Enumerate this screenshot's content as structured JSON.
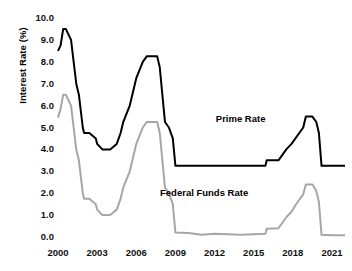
{
  "chart_data": {
    "type": "line",
    "title": "",
    "xlabel": "",
    "ylabel": "Interest Rate (%)",
    "xlim": [
      2000,
      2022
    ],
    "ylim": [
      0.0,
      10.0
    ],
    "grid": false,
    "legend_position": "inline-annotations",
    "x_tick_labels": [
      "2000",
      "2003",
      "2006",
      "2009",
      "2012",
      "2015",
      "2018",
      "2021"
    ],
    "x_tick_values": [
      2000,
      2003,
      2006,
      2009,
      2012,
      2015,
      2018,
      2021
    ],
    "y_tick_labels": [
      "10.0",
      "9.0",
      "8.0",
      "7.0",
      "6.0",
      "5.0",
      "4.0",
      "3.0",
      "2.0",
      "1.0",
      "0.0"
    ],
    "y_tick_values": [
      10.0,
      9.0,
      8.0,
      7.0,
      6.0,
      5.0,
      4.0,
      3.0,
      2.0,
      1.0,
      0.0
    ],
    "annotations": [
      {
        "text": "Prime Rate",
        "x": 2014.0,
        "y": 5.4
      },
      {
        "text": "Federal Funds  Rate",
        "x": 2011.2,
        "y": 2.0
      }
    ],
    "series": [
      {
        "name": "Prime Rate",
        "color": "#000000",
        "x": [
          2000.0,
          2000.2,
          2000.4,
          2000.6,
          2001.0,
          2001.2,
          2001.4,
          2001.6,
          2001.9,
          2002.0,
          2002.4,
          2002.9,
          2003.0,
          2003.4,
          2003.6,
          2004.0,
          2004.5,
          2004.8,
          2005.0,
          2005.5,
          2006.0,
          2006.5,
          2006.8,
          2007.0,
          2007.6,
          2007.8,
          2008.0,
          2008.2,
          2008.5,
          2008.8,
          2009.0,
          2010.0,
          2011.0,
          2012.0,
          2013.0,
          2014.0,
          2015.0,
          2015.9,
          2016.0,
          2016.9,
          2017.2,
          2017.5,
          2017.9,
          2018.2,
          2018.5,
          2018.8,
          2019.0,
          2019.5,
          2019.8,
          2020.0,
          2020.2,
          2021.0,
          2022.0
        ],
        "y": [
          8.5,
          8.75,
          9.5,
          9.5,
          9.0,
          8.0,
          7.0,
          6.5,
          5.0,
          4.75,
          4.75,
          4.5,
          4.25,
          4.0,
          4.0,
          4.0,
          4.25,
          4.75,
          5.25,
          6.0,
          7.25,
          8.0,
          8.25,
          8.25,
          8.25,
          7.75,
          6.5,
          5.25,
          5.0,
          4.5,
          3.25,
          3.25,
          3.25,
          3.25,
          3.25,
          3.25,
          3.25,
          3.25,
          3.5,
          3.5,
          3.75,
          4.0,
          4.25,
          4.5,
          4.75,
          5.0,
          5.5,
          5.5,
          5.25,
          4.75,
          3.25,
          3.25,
          3.25
        ]
      },
      {
        "name": "Federal Funds Rate",
        "color": "#a6a6a6",
        "x": [
          2000.0,
          2000.2,
          2000.4,
          2000.6,
          2001.0,
          2001.2,
          2001.4,
          2001.6,
          2001.9,
          2002.0,
          2002.4,
          2002.9,
          2003.0,
          2003.4,
          2003.6,
          2004.0,
          2004.5,
          2004.8,
          2005.0,
          2005.5,
          2006.0,
          2006.5,
          2006.8,
          2007.0,
          2007.6,
          2007.8,
          2008.0,
          2008.2,
          2008.5,
          2008.8,
          2009.0,
          2010.0,
          2011.0,
          2012.0,
          2013.0,
          2014.0,
          2015.0,
          2015.9,
          2016.0,
          2016.9,
          2017.2,
          2017.5,
          2017.9,
          2018.2,
          2018.5,
          2018.8,
          2019.0,
          2019.5,
          2019.8,
          2020.0,
          2020.2,
          2021.0,
          2022.0
        ],
        "y": [
          5.45,
          5.85,
          6.5,
          6.5,
          6.0,
          5.0,
          4.0,
          3.5,
          2.0,
          1.75,
          1.75,
          1.5,
          1.25,
          1.0,
          1.0,
          1.0,
          1.25,
          1.75,
          2.25,
          3.0,
          4.25,
          5.0,
          5.25,
          5.25,
          5.25,
          4.75,
          3.5,
          2.25,
          2.0,
          1.5,
          0.2,
          0.18,
          0.1,
          0.15,
          0.12,
          0.1,
          0.12,
          0.15,
          0.38,
          0.4,
          0.65,
          0.9,
          1.15,
          1.45,
          1.7,
          1.95,
          2.4,
          2.4,
          2.1,
          1.6,
          0.1,
          0.08,
          0.08
        ]
      }
    ]
  },
  "axes": {
    "y_title": "Interest Rate (%)"
  }
}
